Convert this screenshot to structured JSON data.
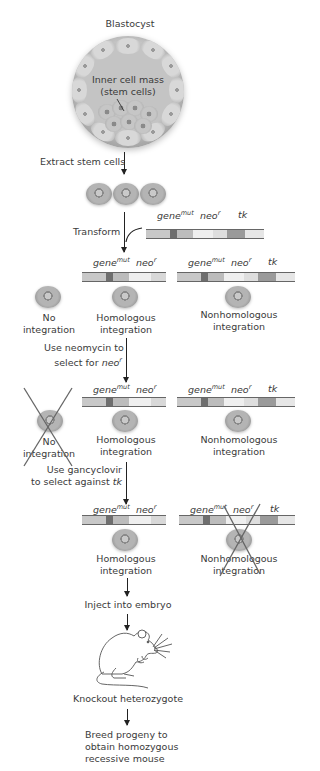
{
  "blastocyst": {
    "label": "Blastocyst",
    "inner_label_line1": "Inner cell mass",
    "inner_label_line2": "(stem cells)"
  },
  "steps": {
    "extract": "Extract stem cells",
    "transform": "Transform",
    "neomycin_line1": "Use neomycin to",
    "neomycin_line2": "select for",
    "neomycin_gene": "neo",
    "neomycin_sup": "r",
    "ganciclovir_line1": "Use gancyclovir",
    "ganciclovir_line2": "to select against",
    "ganciclovir_gene": "tk",
    "inject": "Inject into embryo",
    "result": "Knockout heterozygote",
    "breed_line1": "Breed progeny to",
    "breed_line2": "obtain homozygous",
    "breed_line3": "recessive mouse"
  },
  "genes": {
    "gene": "gene",
    "gene_sup": "mut",
    "neo": "neo",
    "neo_sup": "r",
    "tk": "tk"
  },
  "outcomes": {
    "none_line1": "No",
    "none_line2": "integration",
    "homologous_line1": "Homologous",
    "homologous_line2": "integration",
    "nonhomologous_line1": "Nonhomologous",
    "nonhomologous_line2": "integration"
  },
  "colors": {
    "strand_light": "#e8e8e8",
    "strand_mid": "#bdbdbd",
    "gene_mut_mark": "#6e6e6e",
    "tk_mark": "#9a9a9a",
    "cross": "#666666",
    "arrow": "#222222"
  }
}
